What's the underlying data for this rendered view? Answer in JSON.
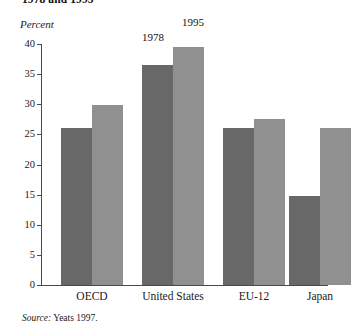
{
  "figure": {
    "title": "1978 and 1995",
    "source_label": "Source:",
    "source_text": " Yeats 1997."
  },
  "chart_data": {
    "type": "bar",
    "title": "1978 and 1995",
    "xlabel": "",
    "ylabel": "Percent",
    "ylim": [
      0,
      40
    ],
    "yticks": [
      0,
      5,
      10,
      15,
      20,
      25,
      30,
      35,
      40
    ],
    "ytick_labels": [
      "0",
      "5",
      "10",
      "15",
      "20",
      "25",
      "30",
      "35",
      "40"
    ],
    "grid": false,
    "legend_position": "annotated-above-bars",
    "categories": [
      "OECD",
      "United States",
      "EU-12",
      "Japan"
    ],
    "series": [
      {
        "name": "1978",
        "color": "#686868",
        "values": [
          26.0,
          36.6,
          26.0,
          14.8
        ]
      },
      {
        "name": "1995",
        "color": "#909090",
        "values": [
          29.8,
          39.5,
          27.5,
          26.0
        ]
      }
    ],
    "annotations": [
      {
        "text": "1978",
        "series": "1978",
        "category": "United States"
      },
      {
        "text": "1995",
        "series": "1995",
        "category": "United States"
      }
    ]
  }
}
